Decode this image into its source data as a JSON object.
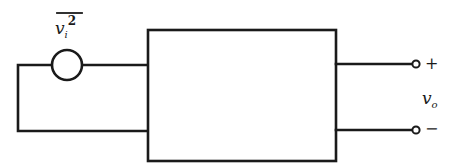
{
  "diagram": {
    "source_label": {
      "symbol": "v",
      "subscript": "i",
      "superscript": "2",
      "overline": true
    },
    "output_label": {
      "symbol": "v",
      "subscript": "o"
    },
    "terminal_plus": "+",
    "terminal_minus": "−",
    "colors": {
      "stroke": "#1a1a1a",
      "background": "#ffffff"
    }
  }
}
